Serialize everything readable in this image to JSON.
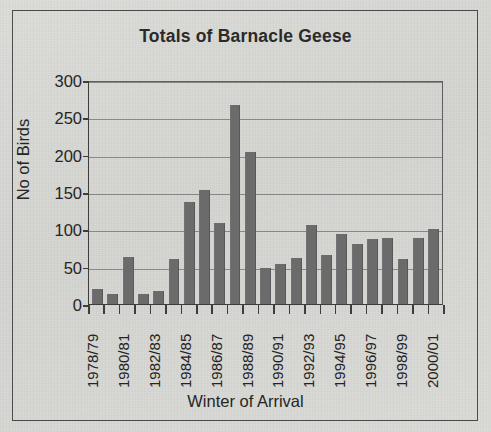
{
  "chart_data": {
    "type": "bar",
    "title": "Totals of Barnacle Geese",
    "xlabel": "Winter of Arrival",
    "ylabel": "No of Birds",
    "ylim": [
      0,
      300
    ],
    "ytick_step": 50,
    "yticks": [
      "0",
      "50",
      "100",
      "150",
      "200",
      "250",
      "300"
    ],
    "grid": true,
    "legend": false,
    "bar_color": "#6b6b6b",
    "background_color": "#d9d9d6",
    "categories": [
      "1978/79",
      "1979/80",
      "1980/81",
      "1981/82",
      "1982/83",
      "1983/84",
      "1984/85",
      "1985/86",
      "1986/87",
      "1987/88",
      "1988/89",
      "1989/90",
      "1990/91",
      "1991/92",
      "1992/93",
      "1993/94",
      "1994/95",
      "1995/96",
      "1996/97",
      "1997/98",
      "1998/99",
      "1999/00",
      "2000/01"
    ],
    "values": [
      20,
      13,
      63,
      14,
      17,
      60,
      136,
      153,
      108,
      267,
      204,
      48,
      54,
      61,
      106,
      65,
      94,
      81,
      87,
      89,
      60,
      89,
      101
    ],
    "tick_labels_visible": [
      "1978/79",
      "",
      "1980/81",
      "",
      "1982/83",
      "",
      "1984/85",
      "",
      "1986/87",
      "",
      "1988/89",
      "",
      "1990/91",
      "",
      "1992/93",
      "",
      "1994/95",
      "",
      "1996/97",
      "",
      "1998/99",
      "",
      "2000/01"
    ]
  }
}
